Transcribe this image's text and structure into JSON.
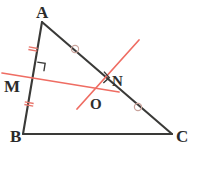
{
  "figure": {
    "canvas": {
      "width": 197,
      "height": 181,
      "background": "#ffffff"
    },
    "colors": {
      "stroke_dark": "#3a3a38",
      "stroke_red": "#ef6d63",
      "tick_red": "#e8766c",
      "circle_mark": "#c9a39c",
      "label_text": "#2b2b2b"
    }
  },
  "labels": {
    "A": {
      "text": "A",
      "x": 36,
      "y": 4
    },
    "B": {
      "text": "B",
      "x": 10,
      "y": 128
    },
    "C": {
      "text": "C",
      "x": 176,
      "y": 128
    },
    "M": {
      "text": "M",
      "x": 4,
      "y": 78
    },
    "N": {
      "text": "N",
      "x": 112,
      "y": 74
    },
    "O": {
      "text": "O",
      "x": 90,
      "y": 97
    }
  },
  "points": {
    "A": {
      "x": 42,
      "y": 22
    },
    "B": {
      "x": 23,
      "y": 134
    },
    "C": {
      "x": 172,
      "y": 134
    },
    "M": {
      "x": 35,
      "y": 72
    },
    "N": {
      "x": 104,
      "y": 80
    },
    "O": {
      "x": 96,
      "y": 92
    }
  },
  "segments": [
    {
      "name": "side-AB",
      "from": "A",
      "to": "B",
      "color": "#3a3a38",
      "width": 2.1
    },
    {
      "name": "side-AC",
      "from": "A",
      "to": "C",
      "color": "#3a3a38",
      "width": 2.1
    },
    {
      "name": "side-BC",
      "from": "B",
      "to": "C",
      "color": "#3a3a38",
      "width": 2.1
    }
  ],
  "red_lines": [
    {
      "name": "perpendicular-bisector-of-AB",
      "x1": 2,
      "y1": 73,
      "x2": 119,
      "y2": 92,
      "color": "#ef6d63",
      "width": 1.7
    },
    {
      "name": "perpendicular-bisector-of-AC",
      "x1": 139,
      "y1": 40,
      "x2": 77,
      "y2": 109,
      "color": "#ef6d63",
      "width": 1.7
    }
  ],
  "right_angle_marks": [
    {
      "name": "right-angle-at-M",
      "cx": 36,
      "cy": 70,
      "size": 8,
      "rotation": 9
    },
    {
      "name": "right-angle-at-N",
      "cx": 98,
      "cy": 77,
      "size": 8,
      "rotation": 48
    }
  ],
  "tick_marks": [
    {
      "name": "tick-on-AM",
      "cx": 33,
      "cy": 49,
      "angle": 10,
      "count": 2
    },
    {
      "name": "tick-on-MB",
      "cx": 29,
      "cy": 104,
      "angle": 10,
      "count": 2
    }
  ],
  "circle_marks": [
    {
      "name": "circle-on-AN",
      "cx": 75,
      "cy": 49,
      "r": 3.6
    },
    {
      "name": "circle-on-NC",
      "cx": 138,
      "cy": 107,
      "r": 3.6
    }
  ]
}
